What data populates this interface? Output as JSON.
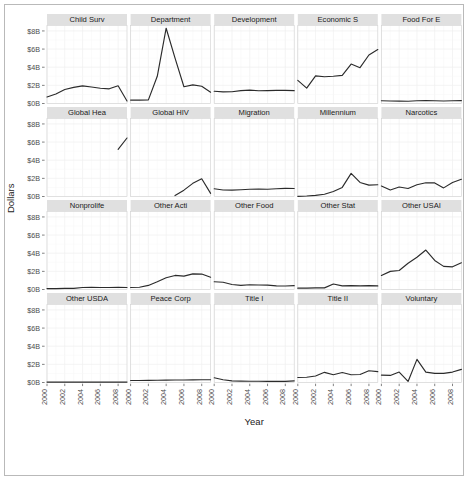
{
  "chart_data": {
    "type": "line",
    "title": "",
    "xlabel": "Year",
    "ylabel": "Dollars",
    "xlim": [
      2000,
      2009
    ],
    "ylim": [
      0,
      8.6
    ],
    "x_ticks": [
      2000,
      2002,
      2004,
      2006,
      2008
    ],
    "x_tick_labels": [
      "2000",
      "2002",
      "2004",
      "2006",
      "2008"
    ],
    "y_ticks": [
      0,
      2,
      4,
      6,
      8
    ],
    "y_tick_labels": [
      "$0B",
      "$2B",
      "$4B",
      "$6B",
      "$8B"
    ],
    "grid": true,
    "legend": "none",
    "facet_rows": 4,
    "facet_cols": 5,
    "units": "billions of dollars",
    "series": [
      {
        "name": "Child Surv",
        "x": [
          2000,
          2001,
          2002,
          2003,
          2004,
          2005,
          2006,
          2007,
          2008,
          2009
        ],
        "values": [
          0.72,
          1.05,
          1.55,
          1.78,
          1.95,
          1.82,
          1.68,
          1.62,
          1.95,
          0.28
        ]
      },
      {
        "name": "Department",
        "x": [
          2000,
          2001,
          2002,
          2003,
          2004,
          2005,
          2006,
          2007,
          2008,
          2009
        ],
        "values": [
          0.38,
          0.38,
          0.4,
          3.0,
          8.3,
          5.0,
          1.85,
          2.05,
          1.9,
          1.25
        ]
      },
      {
        "name": "Development",
        "x": [
          2000,
          2001,
          2002,
          2003,
          2004,
          2005,
          2006,
          2007,
          2008,
          2009
        ],
        "values": [
          1.35,
          1.28,
          1.3,
          1.42,
          1.48,
          1.4,
          1.42,
          1.45,
          1.45,
          1.42
        ]
      },
      {
        "name": "Economic S",
        "x": [
          2000,
          2001,
          2002,
          2003,
          2004,
          2005,
          2006,
          2007,
          2008,
          2009
        ],
        "values": [
          2.55,
          1.7,
          3.05,
          2.95,
          3.0,
          3.1,
          4.35,
          3.95,
          5.35,
          5.95
        ]
      },
      {
        "name": "Food For E",
        "x": [
          2000,
          2001,
          2002,
          2003,
          2004,
          2005,
          2006,
          2007,
          2008,
          2009
        ],
        "values": [
          0.3,
          0.28,
          0.26,
          0.25,
          0.3,
          0.32,
          0.3,
          0.28,
          0.3,
          0.32
        ]
      },
      {
        "name": "Global Hea",
        "x": [
          2008,
          2009
        ],
        "values": [
          5.2,
          6.45
        ]
      },
      {
        "name": "Global HIV",
        "x": [
          2005,
          2006,
          2007,
          2008,
          2009
        ],
        "values": [
          0.1,
          0.7,
          1.45,
          1.95,
          0.35
        ]
      },
      {
        "name": "Migration",
        "x": [
          2000,
          2001,
          2002,
          2003,
          2004,
          2005,
          2006,
          2007,
          2008,
          2009
        ],
        "values": [
          0.85,
          0.72,
          0.7,
          0.75,
          0.8,
          0.82,
          0.8,
          0.85,
          0.9,
          0.88
        ]
      },
      {
        "name": "Millennium",
        "x": [
          2000,
          2001,
          2002,
          2003,
          2004,
          2005,
          2006,
          2007,
          2008,
          2009
        ],
        "values": [
          0.02,
          0.05,
          0.12,
          0.25,
          0.55,
          1.0,
          2.55,
          1.55,
          1.25,
          1.3
        ]
      },
      {
        "name": "Narcotics",
        "x": [
          2000,
          2001,
          2002,
          2003,
          2004,
          2005,
          2006,
          2007,
          2008,
          2009
        ],
        "values": [
          1.15,
          0.72,
          1.05,
          0.88,
          1.3,
          1.52,
          1.5,
          0.95,
          1.55,
          1.9
        ]
      },
      {
        "name": "Nonprolife",
        "x": [
          2000,
          2001,
          2002,
          2003,
          2004,
          2005,
          2006,
          2007,
          2008,
          2009
        ],
        "values": [
          0.1,
          0.1,
          0.12,
          0.13,
          0.22,
          0.24,
          0.22,
          0.22,
          0.24,
          0.22
        ]
      },
      {
        "name": "Other Acti",
        "x": [
          2000,
          2001,
          2002,
          2003,
          2004,
          2005,
          2006,
          2007,
          2008,
          2009
        ],
        "values": [
          0.22,
          0.25,
          0.45,
          0.85,
          1.3,
          1.55,
          1.48,
          1.72,
          1.7,
          1.35
        ]
      },
      {
        "name": "Other Food",
        "x": [
          2000,
          2001,
          2002,
          2003,
          2004,
          2005,
          2006,
          2007,
          2008,
          2009
        ],
        "values": [
          0.85,
          0.8,
          0.55,
          0.45,
          0.52,
          0.5,
          0.48,
          0.4,
          0.38,
          0.42
        ]
      },
      {
        "name": "Other Stat",
        "x": [
          2000,
          2001,
          2002,
          2003,
          2004,
          2005,
          2006,
          2007,
          2008,
          2009
        ],
        "values": [
          0.15,
          0.15,
          0.18,
          0.18,
          0.6,
          0.4,
          0.42,
          0.4,
          0.42,
          0.4
        ]
      },
      {
        "name": "Other USAI",
        "x": [
          2000,
          2001,
          2002,
          2003,
          2004,
          2005,
          2006,
          2007,
          2008,
          2009
        ],
        "values": [
          1.55,
          2.0,
          2.1,
          2.9,
          3.55,
          4.35,
          3.2,
          2.55,
          2.5,
          2.95
        ]
      },
      {
        "name": "Other USDA",
        "x": [
          2000,
          2001,
          2002,
          2003,
          2004,
          2005,
          2006,
          2007,
          2008,
          2009
        ],
        "values": [
          0.05,
          0.05,
          0.05,
          0.05,
          0.05,
          0.05,
          0.05,
          0.05,
          0.05,
          0.05
        ]
      },
      {
        "name": "Peace Corp",
        "x": [
          2000,
          2001,
          2002,
          2003,
          2004,
          2005,
          2006,
          2007,
          2008,
          2009
        ],
        "values": [
          0.22,
          0.22,
          0.24,
          0.25,
          0.26,
          0.27,
          0.28,
          0.29,
          0.3,
          0.3
        ]
      },
      {
        "name": "Title I",
        "x": [
          2000,
          2001,
          2002,
          2003,
          2004,
          2005,
          2006,
          2007,
          2008,
          2009
        ],
        "values": [
          0.52,
          0.3,
          0.18,
          0.15,
          0.14,
          0.14,
          0.13,
          0.12,
          0.12,
          0.18
        ]
      },
      {
        "name": "Title II",
        "x": [
          2000,
          2001,
          2002,
          2003,
          2004,
          2005,
          2006,
          2007,
          2008,
          2009
        ],
        "values": [
          0.55,
          0.58,
          0.72,
          1.12,
          0.85,
          1.1,
          0.85,
          0.88,
          1.3,
          1.2
        ]
      },
      {
        "name": "Voluntary",
        "x": [
          2000,
          2001,
          2002,
          2003,
          2004,
          2005,
          2006,
          2007,
          2008,
          2009
        ],
        "values": [
          0.82,
          0.78,
          1.15,
          0.12,
          2.55,
          1.15,
          1.0,
          1.0,
          1.15,
          1.45
        ]
      }
    ]
  },
  "facets": [
    {
      "label": "Child Surv"
    },
    {
      "label": "Department"
    },
    {
      "label": "Development"
    },
    {
      "label": "Economic S"
    },
    {
      "label": "Food For E"
    },
    {
      "label": "Global Hea"
    },
    {
      "label": "Global HIV"
    },
    {
      "label": "Migration"
    },
    {
      "label": "Millennium"
    },
    {
      "label": "Narcotics"
    },
    {
      "label": "Nonprolife"
    },
    {
      "label": "Other Acti"
    },
    {
      "label": "Other Food"
    },
    {
      "label": "Other Stat"
    },
    {
      "label": "Other USAI"
    },
    {
      "label": "Other USDA"
    },
    {
      "label": "Peace Corp"
    },
    {
      "label": "Title I"
    },
    {
      "label": "Title II"
    },
    {
      "label": "Voluntary"
    }
  ]
}
